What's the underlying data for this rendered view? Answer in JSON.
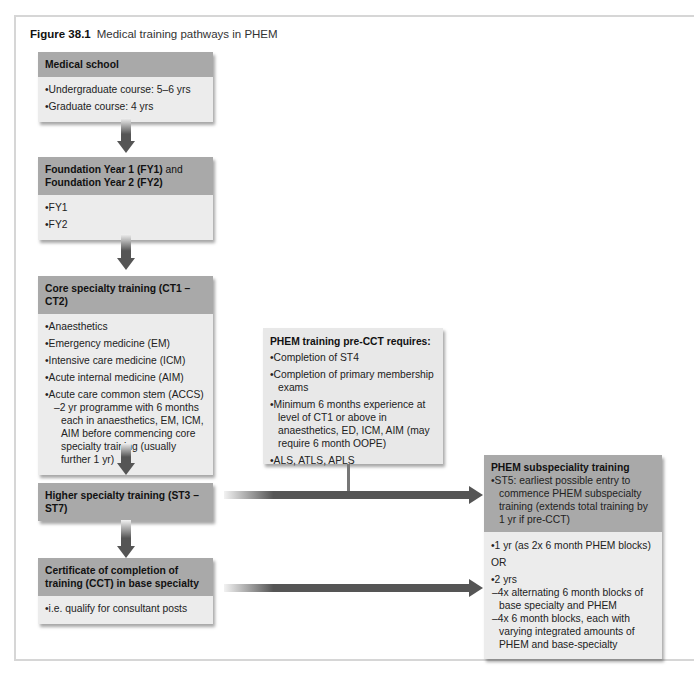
{
  "figure": {
    "label": "Figure 38.1",
    "title": "Medical training pathways in PHEM"
  },
  "boxes": {
    "medical_school": {
      "header": "Medical school",
      "items": [
        "Undergraduate course: 5–6 yrs",
        "Graduate course: 4 yrs"
      ]
    },
    "foundation": {
      "header_line1_bold": "Foundation Year 1 (FY1)",
      "header_line1_normal": " and",
      "header_line2_bold": "Foundation Year 2 (FY2)",
      "items": [
        "FY1",
        "FY2"
      ]
    },
    "core": {
      "header": "Core specialty training (CT1 – CT2)",
      "items": [
        "Anaesthetics",
        "Emergency medicine (EM)",
        "Intensive care medicine (ICM)",
        "Acute internal medicine (AIM)",
        "Acute care common stem (ACCS)"
      ],
      "sub_item": "2 yr programme with 6 months each in anaesthetics, EM, ICM, AIM before commencing core specialty training (usually further 1 yr)"
    },
    "higher": {
      "header": "Higher specialty training (ST3 – ST7)"
    },
    "cct": {
      "header": "Certificate of completion of training (CCT) in base specialty",
      "items": [
        "i.e. qualify for consultant posts"
      ]
    },
    "pre_cct": {
      "title": "PHEM training pre-CCT requires:",
      "items": [
        "Completion of ST4",
        "Completion of primary membership exams",
        "Minimum 6 months experience at level of CT1 or above in anaesthetics, ED, ICM, AIM (may require 6 month OOPE)",
        "ALS, ATLS, APLS"
      ]
    },
    "phem_sub": {
      "title": "PHEM subspeciality training",
      "header_item": "ST5: earliest possible entry to commence PHEM subspecialty training (extends total training by 1 yr if pre-CCT)",
      "option1": "1 yr (as 2x 6 month PHEM blocks)",
      "or_label": "OR",
      "option2": "2 yrs",
      "option2_subs": [
        "4x alternating 6 month blocks of base specialty and PHEM",
        "4x 6 month blocks, each with varying integrated amounts of PHEM and base-specialty"
      ]
    }
  },
  "colors": {
    "header_bg": "#a9a9a9",
    "body_bg": "#ececec",
    "arrow": "#555555",
    "frame": "#d6d6d6"
  }
}
